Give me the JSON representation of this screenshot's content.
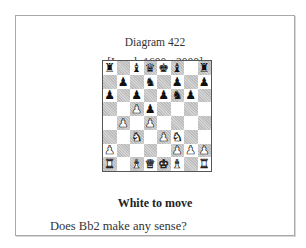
{
  "diagram": {
    "title": "Diagram 422",
    "level": "[Level: 1600 - 2000]",
    "caption": "White to move",
    "question": "Does Bb2 make any sense?"
  },
  "board": {
    "orientation": "white",
    "light_square_color": "#ffffff",
    "dark_square_color": "#c9c9c9",
    "ranks": [
      [
        "bR",
        "",
        "bB",
        "bQ",
        "bK",
        "bB",
        "",
        "bR"
      ],
      [
        "",
        "bP",
        "",
        "bN",
        "",
        "bP",
        "",
        "bP"
      ],
      [
        "bP",
        "",
        "bP",
        "",
        "bP",
        "bN",
        "bP",
        ""
      ],
      [
        "",
        "",
        "wP",
        "bP",
        "",
        "",
        "",
        ""
      ],
      [
        "",
        "wP",
        "",
        "wP",
        "",
        "",
        "",
        ""
      ],
      [
        "",
        "",
        "wN",
        "",
        "wP",
        "wN",
        "",
        ""
      ],
      [
        "wP",
        "",
        "",
        "",
        "",
        "wP",
        "wP",
        "wP"
      ],
      [
        "wR",
        "",
        "wB",
        "wQ",
        "wK",
        "wB",
        "",
        "wR"
      ]
    ],
    "glyphs": {
      "K": "♚",
      "Q": "♛",
      "R": "♜",
      "B": "♝",
      "N": "♞",
      "P": "♟"
    }
  }
}
